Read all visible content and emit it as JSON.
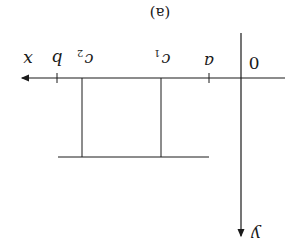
{
  "figure": {
    "caption": "(a)",
    "orientation": "rotated 180 degrees",
    "line_color": "#1a1a1a",
    "axes": {
      "x_label": "x",
      "y_label": "y",
      "origin_label": "0"
    },
    "ticks": [
      {
        "label": "a"
      },
      {
        "label": "b"
      }
    ],
    "markers": [
      {
        "label": "c",
        "sub": "1"
      },
      {
        "label": "c",
        "sub": "2"
      }
    ]
  }
}
